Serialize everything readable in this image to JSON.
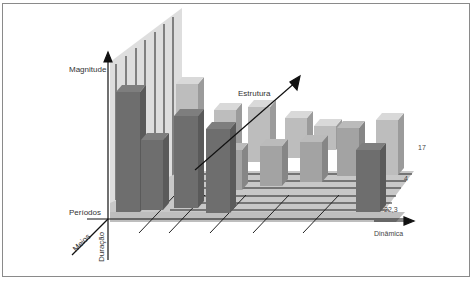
{
  "chart_data": {
    "type": "bar",
    "subtype": "3d-conceptual",
    "title": "",
    "axes": {
      "vertical": "Magnitude",
      "depth": "Estrutura",
      "horizontal": "Dinâmica",
      "left_horizontal": "Períodos",
      "diagonal_front": "Meios",
      "vertical_down": "Duração"
    },
    "tick_labels": [
      "17",
      "4",
      "22,3"
    ],
    "grid": true,
    "legend": null,
    "colors": {
      "front_row": "#6e6e6e",
      "middle_row": "#a3a3a3",
      "back_row": "#bdbdbd",
      "floor": "#c9c9c9",
      "back_wall": "#dcdcdc",
      "axis": "#111111"
    },
    "bars": [
      {
        "row": "front",
        "x": 116,
        "base": 212,
        "w": 24,
        "h": 120
      },
      {
        "row": "front",
        "x": 141,
        "base": 210,
        "w": 22,
        "h": 70
      },
      {
        "row": "front",
        "x": 174,
        "base": 208,
        "w": 24,
        "h": 92
      },
      {
        "row": "front",
        "x": 206,
        "base": 213,
        "w": 24,
        "h": 84
      },
      {
        "row": "front",
        "x": 356,
        "base": 212,
        "w": 24,
        "h": 62
      },
      {
        "row": "middle",
        "x": 220,
        "base": 190,
        "w": 22,
        "h": 40
      },
      {
        "row": "middle",
        "x": 260,
        "base": 186,
        "w": 22,
        "h": 40
      },
      {
        "row": "middle",
        "x": 300,
        "base": 182,
        "w": 22,
        "h": 40
      },
      {
        "row": "middle",
        "x": 337,
        "base": 176,
        "w": 22,
        "h": 48
      },
      {
        "row": "back",
        "x": 176,
        "base": 170,
        "w": 22,
        "h": 86
      },
      {
        "row": "back",
        "x": 214,
        "base": 165,
        "w": 22,
        "h": 55
      },
      {
        "row": "back",
        "x": 248,
        "base": 162,
        "w": 22,
        "h": 55
      },
      {
        "row": "back",
        "x": 285,
        "base": 158,
        "w": 22,
        "h": 40
      },
      {
        "row": "back",
        "x": 376,
        "base": 175,
        "w": 22,
        "h": 55
      },
      {
        "row": "back",
        "x": 314,
        "base": 150,
        "w": 22,
        "h": 24
      }
    ]
  }
}
